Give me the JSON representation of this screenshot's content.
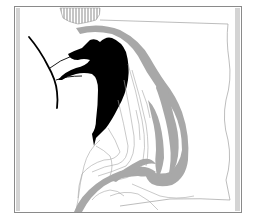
{
  "map": {
    "type": "river-channel-map",
    "colors": {
      "background": "#ffffff",
      "frame": "#8a8a8a",
      "frame_strip": "#d4d4d4",
      "channel_fill": "#a8a8a8",
      "land_line": "#9c9c9c",
      "solid_mass": "#000000",
      "hatch": "#8c8c8c"
    },
    "layers": [
      {
        "name": "frame"
      },
      {
        "name": "hatched-area-top"
      },
      {
        "name": "main-gray-channel"
      },
      {
        "name": "secondary-gray-channels"
      },
      {
        "name": "black-water-body"
      },
      {
        "name": "black-curve-line"
      },
      {
        "name": "contour-lines"
      },
      {
        "name": "outer-boundary-line"
      }
    ]
  }
}
